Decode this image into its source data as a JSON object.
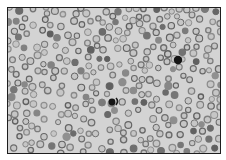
{
  "image": {
    "subject": "blood smear micrograph",
    "description": "Grayscale light-microscopy field of numerous red blood cells (ring-shaped erythrocytes) with two darkly stained nucleated cells",
    "colors": {
      "border": "#1e1e1e",
      "background": "#d3d3d3",
      "cell_ring": "#7a7a7a",
      "cell_center": "#c6c6c6",
      "dark_cell": "#151515",
      "page": "#ffffff"
    },
    "notable_objects": [
      {
        "name": "dark-cell-upper-right",
        "label": "darkly stained cell"
      },
      {
        "name": "dark-cell-center",
        "label": "darkly stained cell with adjacent fragment"
      }
    ]
  }
}
